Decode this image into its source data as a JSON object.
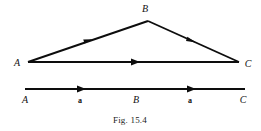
{
  "figure": {
    "caption": "Fig. 15.4",
    "stroke_color": "#0d0d0d",
    "background_color": "#ffffff",
    "triangle": {
      "vertices": [
        {
          "name": "A",
          "label": "A",
          "label_x": 17,
          "label_y": 66,
          "point_x": 28,
          "point_y": 62
        },
        {
          "name": "B",
          "label": "B",
          "label_x": 141,
          "label_y": 12,
          "point_x": 148,
          "point_y": 21
        },
        {
          "name": "C",
          "label": "C",
          "label_x": 243,
          "label_y": 67,
          "point_x": 239,
          "point_y": 62
        }
      ],
      "edges": [
        {
          "name": "AB",
          "from": "A",
          "to": "B",
          "arrow_t": 0.5
        },
        {
          "name": "BC",
          "from": "B",
          "to": "C",
          "arrow_t": 0.47
        },
        {
          "name": "AC",
          "from": "A",
          "to": "C",
          "arrow_t": 0.5
        }
      ]
    },
    "number_line": {
      "start_x": 25,
      "end_x": 245,
      "y": 89,
      "arrow_positions_x": [
        82,
        192
      ],
      "labels": [
        {
          "name": "point-A",
          "text": "A",
          "x": 25,
          "y": 103,
          "style": "italic"
        },
        {
          "name": "magnitude-a-left",
          "text": "a",
          "x": 80,
          "y": 103,
          "style": "bold"
        },
        {
          "name": "point-B",
          "text": "B",
          "x": 135,
          "y": 103,
          "style": "italic"
        },
        {
          "name": "magnitude-a-right",
          "text": "a",
          "x": 190,
          "y": 103,
          "style": "bold"
        },
        {
          "name": "point-C",
          "text": "C",
          "x": 243,
          "y": 103,
          "style": "italic"
        }
      ]
    }
  }
}
